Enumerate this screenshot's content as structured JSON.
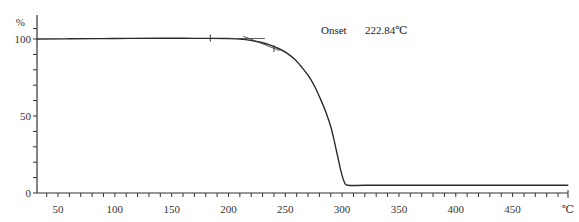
{
  "chart_data": {
    "type": "line",
    "title": "",
    "xlabel": "℃",
    "ylabel": "%",
    "xlim": [
      31.5,
      499
    ],
    "ylim": [
      0,
      108
    ],
    "grid": false,
    "legend": null,
    "x_ticks": [
      50,
      100,
      150,
      200,
      250,
      300,
      350,
      400,
      450
    ],
    "x_minor_step": 10,
    "y_ticks": [
      0,
      50,
      100
    ],
    "y_minor_step": 10,
    "annotations": [
      {
        "text": "Onset",
        "value": "222.84℃"
      }
    ],
    "markers": [
      184,
      240
    ],
    "series": [
      {
        "name": "TGA",
        "x": [
          31.5,
          60,
          100,
          140,
          170,
          200,
          215,
          225,
          235,
          245,
          252,
          258,
          263,
          270,
          276,
          281,
          286,
          290,
          293,
          296,
          299,
          302,
          305,
          320,
          350,
          400,
          450,
          499
        ],
        "y": [
          100.0,
          100.1,
          100.3,
          100.5,
          100.4,
          100.3,
          99.6,
          98.4,
          96.5,
          93.5,
          90.5,
          87.0,
          83.0,
          76.5,
          69.0,
          61.0,
          52.0,
          43.0,
          34.0,
          24.0,
          14.0,
          7.0,
          5.0,
          5.0,
          5.0,
          5.0,
          5.0,
          5.0
        ]
      }
    ],
    "tangents": [
      {
        "x": [
          200,
          232
        ],
        "y": [
          100.3,
          100.3
        ]
      },
      {
        "x": [
          213,
          245
        ],
        "y": [
          101.8,
          92.5
        ]
      }
    ]
  },
  "labels": {
    "y_unit": "%",
    "x_unit": "℃",
    "onset_label": "Onset",
    "onset_value": "222.84℃"
  }
}
